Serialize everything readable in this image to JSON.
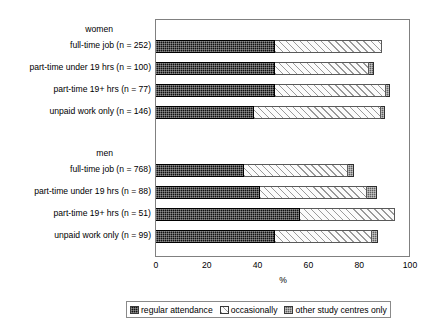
{
  "chart_data": {
    "type": "bar",
    "subtype": "stacked-horizontal-bar",
    "title": "",
    "xlabel": "%",
    "ylabel": "",
    "xlim": [
      0,
      100
    ],
    "xticks": [
      0,
      20,
      40,
      60,
      80,
      100
    ],
    "xticklabels": [
      "0",
      "20",
      "40",
      "60",
      "80",
      "100"
    ],
    "grid": false,
    "legend_position": "bottom",
    "series": [
      {
        "name": "regular attendance",
        "key": "regular",
        "color": "#111111",
        "pattern": "dark-checker"
      },
      {
        "name": "occasionally",
        "key": "occasional",
        "color": "#fbfbfb",
        "pattern": "diagonal-hatch"
      },
      {
        "name": "other study centres only",
        "key": "other",
        "color": "#606060",
        "pattern": "grey-checker"
      }
    ],
    "groups": [
      {
        "label": "women",
        "categories": [
          {
            "label": "full-time job (n = 252)",
            "n": 252,
            "values": [
              47.0,
              42.0,
              0.0
            ]
          },
          {
            "label": "part-time under 19 hrs (n = 100)",
            "n": 100,
            "values": [
              47.0,
              37.0,
              2.0
            ]
          },
          {
            "label": "part-time 19+ hrs (n = 77)",
            "n": 77,
            "values": [
              47.0,
              43.5,
              1.5
            ]
          },
          {
            "label": "unpaid work only (n = 146)",
            "n": 146,
            "values": [
              38.5,
              50.0,
              1.5
            ]
          }
        ]
      },
      {
        "label": "men",
        "categories": [
          {
            "label": "full-time job (n = 768)",
            "n": 768,
            "values": [
              34.5,
              41.0,
              2.5
            ]
          },
          {
            "label": "part-time under 19 hrs (n = 88)",
            "n": 88,
            "values": [
              41.0,
              42.0,
              4.0
            ]
          },
          {
            "label": "part-time 19+ hrs (n = 51)",
            "n": 51,
            "values": [
              56.7,
              37.3,
              0.0
            ]
          },
          {
            "label": "unpaid work only (n = 99)",
            "n": 99,
            "values": [
              47.0,
              38.0,
              2.5
            ]
          }
        ]
      }
    ]
  },
  "legend": {
    "items": [
      {
        "label": "regular attendance"
      },
      {
        "label": "occasionally"
      },
      {
        "label": "other study centres only"
      }
    ]
  },
  "axis": {
    "x_title": "%"
  }
}
